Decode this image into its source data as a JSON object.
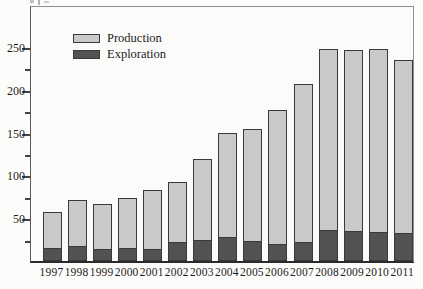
{
  "chart_data": {
    "type": "bar",
    "stacked": true,
    "stack_order": [
      "Exploration",
      "Production"
    ],
    "categories": [
      "1997",
      "1998",
      "1999",
      "2000",
      "2001",
      "2002",
      "2003",
      "2004",
      "2005",
      "2006",
      "2007",
      "2008",
      "2009",
      "2010",
      "2011"
    ],
    "series": [
      {
        "name": "Production",
        "color": "#c9c9c9",
        "values": [
          42,
          54,
          52,
          58,
          69,
          70,
          95,
          122,
          131,
          157,
          184,
          211,
          211,
          214,
          202
        ]
      },
      {
        "name": "Exploration",
        "color": "#525252",
        "values": [
          15,
          17,
          14,
          15,
          14,
          22,
          25,
          28,
          23,
          20,
          22,
          36,
          35,
          34,
          33
        ]
      }
    ],
    "totals": [
      57,
      71,
      66,
      73,
      83,
      92,
      120,
      150,
      154,
      177,
      206,
      247,
      246,
      248,
      235
    ],
    "title": "",
    "xlabel": "",
    "ylabel": "",
    "ylim": [
      0,
      300
    ],
    "y_ticks_major": [
      50,
      100,
      150,
      200,
      250
    ],
    "y_ticks_minor": [
      25,
      75,
      125,
      175,
      225
    ],
    "grid": false,
    "legend": {
      "position": "top-left-inside",
      "entries": [
        "Production",
        "Exploration"
      ]
    }
  },
  "colors": {
    "background": "#fcfcfb",
    "frame": "#8f8f8f",
    "axis": "#2b2b2b",
    "tick": "#444444",
    "text": "#1c1c1c",
    "bar_border": "#3a3a3a",
    "production_fill": "#c9c9c9",
    "exploration_fill": "#525252"
  }
}
